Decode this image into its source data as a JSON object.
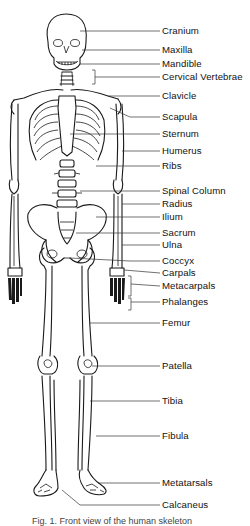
{
  "figure": {
    "caption": "Fig. 1. Front view of the human skeleton",
    "labels": [
      {
        "text": "Cranium",
        "y": 31
      },
      {
        "text": "Maxilla",
        "y": 50
      },
      {
        "text": "Mandible",
        "y": 64
      },
      {
        "text": "Cervical Vertebrae",
        "y": 77
      },
      {
        "text": "Clavicle",
        "y": 96
      },
      {
        "text": "Scapula",
        "y": 117
      },
      {
        "text": "Sternum",
        "y": 134
      },
      {
        "text": "Humerus",
        "y": 151
      },
      {
        "text": "Ribs",
        "y": 166
      },
      {
        "text": "Spinal Column",
        "y": 191
      },
      {
        "text": "Radius",
        "y": 204
      },
      {
        "text": "Ilium",
        "y": 217
      },
      {
        "text": "Sacrum",
        "y": 233
      },
      {
        "text": "Ulna",
        "y": 245
      },
      {
        "text": "Coccyx",
        "y": 261
      },
      {
        "text": "Carpals",
        "y": 273
      },
      {
        "text": "Metacarpals",
        "y": 286
      },
      {
        "text": "Phalanges",
        "y": 302
      },
      {
        "text": "Femur",
        "y": 323
      },
      {
        "text": "Patella",
        "y": 366
      },
      {
        "text": "Tibia",
        "y": 401
      },
      {
        "text": "Fibula",
        "y": 436
      },
      {
        "text": "Metatarsals",
        "y": 483
      },
      {
        "text": "Calcaneus",
        "y": 505
      }
    ]
  }
}
